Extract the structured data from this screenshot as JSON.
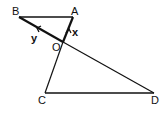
{
  "diagram": {
    "points": {
      "A": {
        "label": "A",
        "x": 73,
        "y": 17
      },
      "B": {
        "label": "B",
        "x": 19,
        "y": 17
      },
      "O": {
        "label": "O",
        "x": 63,
        "y": 42
      },
      "C": {
        "label": "C",
        "x": 45,
        "y": 93
      },
      "D": {
        "label": "D",
        "x": 154,
        "y": 93
      }
    },
    "segments": [
      "BA",
      "BD",
      "AC",
      "CD"
    ],
    "vectors": [
      {
        "label": "x",
        "from": "O",
        "to": "A"
      },
      {
        "label": "y",
        "from": "O",
        "to": "B"
      }
    ],
    "line_color": "#111111"
  }
}
